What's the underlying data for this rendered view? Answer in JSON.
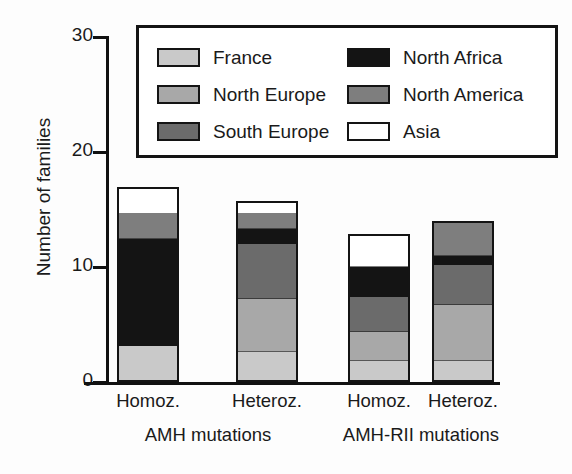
{
  "chart_data": {
    "type": "bar",
    "subtype": "stacked",
    "title": "",
    "xlabel": "",
    "ylabel": "Number of families",
    "ylim": [
      0,
      30
    ],
    "yticks": [
      0,
      10,
      20,
      30
    ],
    "ytick_labels": [
      "0",
      "10",
      "20",
      "30"
    ],
    "grid": false,
    "legend_position": "upper-center-inside",
    "categories": [
      "Homoz.",
      "Heteroz.",
      "Homoz.",
      "Heteroz."
    ],
    "group_labels": [
      "AMH mutations",
      "AMH-RII mutations"
    ],
    "series": [
      {
        "name": "France",
        "color": "#c9c9c9",
        "values": [
          3.0,
          2.5,
          1.7,
          1.7
        ]
      },
      {
        "name": "North Europe",
        "color": "#a8a8a8",
        "values": [
          0.0,
          4.7,
          2.6,
          5.0
        ]
      },
      {
        "name": "South Europe",
        "color": "#6b6b6b",
        "values": [
          0.0,
          4.9,
          3.1,
          3.6
        ]
      },
      {
        "name": "North Africa",
        "color": "#141414",
        "values": [
          9.5,
          1.3,
          2.7,
          0.8
        ]
      },
      {
        "name": "North America",
        "color": "#7e7e7e",
        "values": [
          2.2,
          1.4,
          0.0,
          2.9
        ]
      },
      {
        "name": "Asia",
        "color": "#ffffff",
        "values": [
          2.3,
          0.9,
          2.8,
          0.0
        ]
      }
    ],
    "totals": [
      17.0,
      15.7,
      12.9,
      14.0
    ]
  },
  "axis": {
    "ylabel": "Number of families",
    "yticks": [
      {
        "label": "30",
        "value": 30
      },
      {
        "label": "20",
        "value": 20
      },
      {
        "label": "10",
        "value": 10
      },
      {
        "label": "0",
        "value": 0
      }
    ]
  },
  "xaxis": {
    "ticks": [
      {
        "label": "Homoz."
      },
      {
        "label": "Heteroz."
      },
      {
        "label": "Homoz."
      },
      {
        "label": "Heteroz."
      }
    ],
    "groups": [
      {
        "label": "AMH mutations"
      },
      {
        "label": "AMH-RII mutations"
      }
    ]
  },
  "legend": {
    "left_column": [
      {
        "label": "France",
        "color": "#c9c9c9"
      },
      {
        "label": "North Europe",
        "color": "#a8a8a8"
      },
      {
        "label": "South Europe",
        "color": "#6b6b6b"
      }
    ],
    "right_column": [
      {
        "label": "North Africa",
        "color": "#141414"
      },
      {
        "label": "North America",
        "color": "#7e7e7e"
      },
      {
        "label": "Asia",
        "color": "#ffffff"
      }
    ]
  }
}
